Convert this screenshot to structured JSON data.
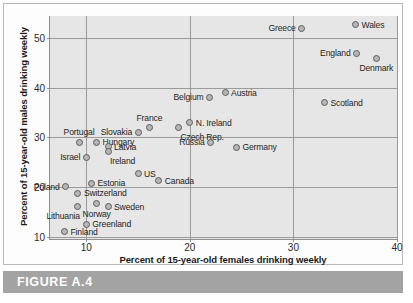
{
  "figure": {
    "caption": "FIGURE A.4"
  },
  "chart_data": {
    "type": "scatter",
    "title": "",
    "xlabel": "Percent of 15-year-old females drinking weekly",
    "ylabel": "Percent of 15-year-old males drinking weekly",
    "xlim": [
      6.5,
      40
    ],
    "ylim": [
      9.5,
      54.5
    ],
    "xticks": [
      10,
      20,
      30,
      40
    ],
    "yticks": [
      10,
      20,
      30,
      40,
      50
    ],
    "grid": true,
    "legend": "none",
    "plot_bgcolor": "#e6e6e6",
    "marker_color": "#b6b6b6",
    "marker_edge_color": "#5e5e5e",
    "points": [
      {
        "label": "Greece",
        "x": 30.8,
        "y": 52.0,
        "pos": "left"
      },
      {
        "label": "Wales",
        "x": 36.0,
        "y": 52.7,
        "pos": "right"
      },
      {
        "label": "England",
        "x": 36.1,
        "y": 47.0,
        "pos": "left"
      },
      {
        "label": "Denmark",
        "x": 38.0,
        "y": 46.0,
        "pos": "below"
      },
      {
        "label": "Austria",
        "x": 23.4,
        "y": 39.0,
        "pos": "right"
      },
      {
        "label": "Belgium",
        "x": 21.9,
        "y": 38.1,
        "pos": "left"
      },
      {
        "label": "Scotland",
        "x": 33.0,
        "y": 37.0,
        "pos": "right"
      },
      {
        "label": "N. Ireland",
        "x": 20.0,
        "y": 33.0,
        "pos": "right"
      },
      {
        "label": "France",
        "x": 16.1,
        "y": 32.0,
        "pos": "above"
      },
      {
        "label": "Czech Rep.",
        "x": 18.9,
        "y": 32.0,
        "pos": "below-right"
      },
      {
        "label": "Slovakia",
        "x": 15.0,
        "y": 31.0,
        "pos": "left"
      },
      {
        "label": "Portugal",
        "x": 9.3,
        "y": 29.0,
        "pos": "above"
      },
      {
        "label": "Hungary",
        "x": 11.0,
        "y": 29.0,
        "pos": "right"
      },
      {
        "label": "Russia",
        "x": 22.0,
        "y": 29.0,
        "pos": "left"
      },
      {
        "label": "Latvia",
        "x": 12.1,
        "y": 28.1,
        "pos": "right"
      },
      {
        "label": "Germany",
        "x": 24.5,
        "y": 28.0,
        "pos": "right"
      },
      {
        "label": "Ireland",
        "x": 12.1,
        "y": 27.1,
        "pos": "below-right"
      },
      {
        "label": "Israel",
        "x": 10.0,
        "y": 26.0,
        "pos": "left"
      },
      {
        "label": "US",
        "x": 15.0,
        "y": 22.7,
        "pos": "right"
      },
      {
        "label": "Canada",
        "x": 17.0,
        "y": 21.3,
        "pos": "right"
      },
      {
        "label": "Estonia",
        "x": 10.5,
        "y": 20.7,
        "pos": "right"
      },
      {
        "label": "Poland",
        "x": 8.0,
        "y": 20.0,
        "pos": "left"
      },
      {
        "label": "Switzerland",
        "x": 9.2,
        "y": 18.7,
        "pos": "right"
      },
      {
        "label": "Norway",
        "x": 11.0,
        "y": 16.6,
        "pos": "below"
      },
      {
        "label": "Lithuania",
        "x": 9.2,
        "y": 16.0,
        "pos": "below-left"
      },
      {
        "label": "Sweden",
        "x": 12.1,
        "y": 16.0,
        "pos": "right"
      },
      {
        "label": "Greenland",
        "x": 10.0,
        "y": 12.5,
        "pos": "right"
      },
      {
        "label": "Finland",
        "x": 7.9,
        "y": 11.0,
        "pos": "right"
      }
    ]
  }
}
